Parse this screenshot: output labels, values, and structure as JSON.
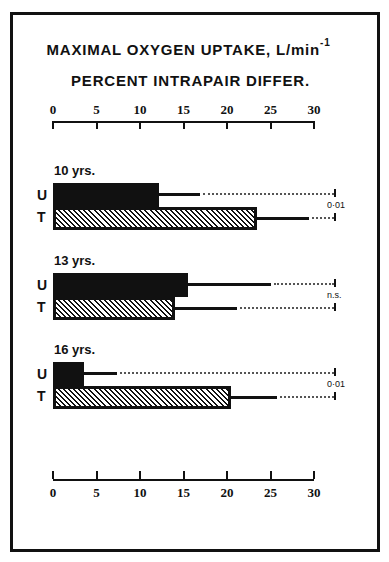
{
  "chart_data": {
    "type": "bar",
    "orientation": "horizontal",
    "title": "MAXIMAL OXYGEN UPTAKE, L/min-1",
    "subtitle": "PERCENT INTRAPAIR DIFFER.",
    "xlabel": "Percent intrapair difference",
    "xlim": [
      0,
      30
    ],
    "xticks": [
      0,
      5,
      10,
      15,
      20,
      25,
      30
    ],
    "grid": false,
    "legend": "U = untrained, T = trained (row labels)",
    "categories": [
      "10 yrs.",
      "13 yrs.",
      "16 yrs."
    ],
    "series": [
      {
        "name": "U",
        "fill": "solid black",
        "values": [
          12.2,
          15.5,
          3.6
        ],
        "error_upper": [
          16.9,
          25.1,
          7.4
        ]
      },
      {
        "name": "T",
        "fill": "diagonal hatch",
        "values": [
          23.4,
          14.0,
          20.5
        ],
        "error_upper": [
          29.4,
          21.1,
          25.8
        ]
      }
    ],
    "significance": [
      "0·01",
      "n.s.",
      "0·01"
    ]
  },
  "title": {
    "line1": "MAXIMAL OXYGEN UPTAKE, L/min",
    "line1_sup": "-1",
    "line2": "PERCENT INTRAPAIR DIFFER."
  },
  "axis": {
    "ticks": [
      "0",
      "5",
      "10",
      "15",
      "20",
      "25",
      "30"
    ]
  },
  "groups": [
    {
      "label": "10 yrs.",
      "u_label": "U",
      "t_label": "T",
      "sig": "0·01"
    },
    {
      "label": "13 yrs.",
      "u_label": "U",
      "t_label": "T",
      "sig": "n.s."
    },
    {
      "label": "16 yrs.",
      "u_label": "U",
      "t_label": "T",
      "sig": "0·01"
    }
  ]
}
